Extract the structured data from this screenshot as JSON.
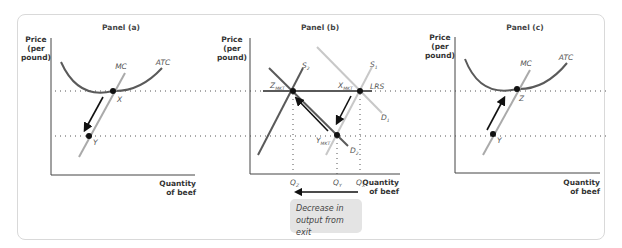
{
  "panels": {
    "a": {
      "title": "Panel (a)",
      "y_label": [
        "Price",
        "(per",
        "pound)"
      ],
      "x_label": [
        "Quantity",
        "of beef"
      ],
      "curves": {
        "mc": "MC",
        "atc": "ATC"
      },
      "points": {
        "x": "X",
        "y": "Y"
      }
    },
    "b": {
      "title": "Panel (b)",
      "y_label": [
        "Price",
        "(per",
        "pound)"
      ],
      "x_label": [
        "Quantity",
        "of beef"
      ],
      "curves": {
        "s1": "S",
        "s1_sub": "1",
        "s2": "S",
        "s2_sub": "2",
        "d1": "D",
        "d1_sub": "1",
        "d2": "D",
        "d2_sub": "2",
        "lrs": "LRS"
      },
      "points": {
        "z": "Z",
        "z_sub": "MKT",
        "x": "X",
        "x_sub": "MKT",
        "y": "Y",
        "y_sub": "MKT"
      },
      "quantities": {
        "qz": "Q",
        "qz_sub": "Z",
        "qy": "Q",
        "qy_sub": "Y",
        "qx": "Q",
        "qx_sub": "X"
      },
      "note": [
        "Decrease in",
        "output from exit"
      ]
    },
    "c": {
      "title": "Panel (c)",
      "y_label": [
        "Price",
        "(per",
        "pound)"
      ],
      "x_label": [
        "Quantity",
        "of beef"
      ],
      "curves": {
        "mc": "MC",
        "atc": "ATC"
      },
      "points": {
        "z": "Z",
        "y": "Y"
      }
    }
  },
  "colors": {
    "curve_dark": "#5a5a5a",
    "curve_light": "#c8c8c8",
    "arrow": "#111111",
    "note_bg": "#e4e4e4",
    "frame": "#d9d9d9"
  }
}
